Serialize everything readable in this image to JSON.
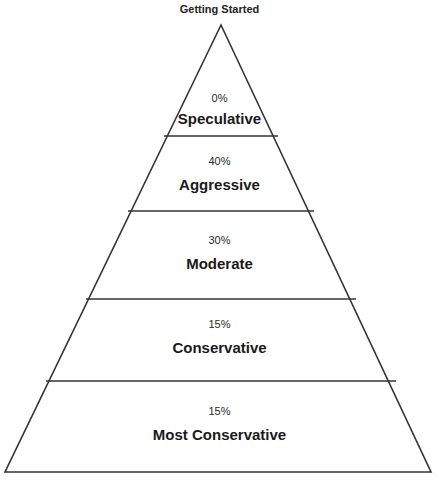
{
  "title": "Getting Started",
  "colors": {
    "line": "#333333",
    "background": "#ffffff",
    "text": "#1a1a1a"
  },
  "tiers": [
    {
      "percent": "0%",
      "label": "Speculative"
    },
    {
      "percent": "40%",
      "label": "Aggressive"
    },
    {
      "percent": "30%",
      "label": "Moderate"
    },
    {
      "percent": "15%",
      "label": "Conservative"
    },
    {
      "percent": "15%",
      "label": "Most Conservative"
    }
  ]
}
